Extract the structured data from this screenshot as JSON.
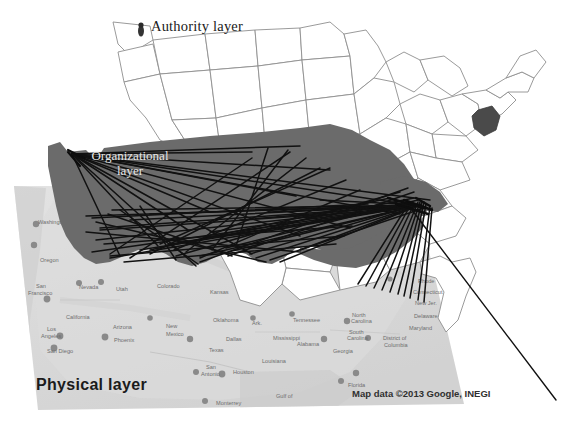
{
  "figure": {
    "type": "layered-network-map-diagram"
  },
  "layers": {
    "authority": {
      "label": "Authority layer",
      "style": "white outline map of US states",
      "outline_color": "#8c8c8c",
      "highlight_region": "Maryland",
      "highlight_color": "#4a4a4a"
    },
    "organizational": {
      "label_line1": "Organizational",
      "label_line2": "layer",
      "style": "dark gray filled US silhouette with black network edges",
      "fill_color": "#6b6b6b",
      "edge_color": "#111111",
      "label_color": "#e8e8e8"
    },
    "physical": {
      "label": "Physical layer",
      "style": "light gray Google Maps terrain in perspective",
      "fill_color": "#d9d9d9",
      "label_color": "#1b1b1b"
    }
  },
  "attribution": {
    "text": "Map data ©2013 Google, INEGI"
  },
  "map_labels": {
    "states": [
      {
        "name": "Washington",
        "x": 38,
        "y": 224
      },
      {
        "name": "Oregon",
        "x": 40,
        "y": 262
      },
      {
        "name": "Nevada",
        "x": 79,
        "y": 289
      },
      {
        "name": "California",
        "x": 66,
        "y": 319
      },
      {
        "name": "Utah",
        "x": 116,
        "y": 291
      },
      {
        "name": "Colorado",
        "x": 157,
        "y": 288
      },
      {
        "name": "Arizona",
        "x": 113,
        "y": 329
      },
      {
        "name": "New",
        "x": 166,
        "y": 328
      },
      {
        "name": "Mexico",
        "x": 166,
        "y": 336
      },
      {
        "name": "Texas",
        "x": 209,
        "y": 352
      },
      {
        "name": "Kansas",
        "x": 210,
        "y": 294
      },
      {
        "name": "Oklahoma",
        "x": 213,
        "y": 322
      },
      {
        "name": "Ark.",
        "x": 252,
        "y": 325
      },
      {
        "name": "Louisiana",
        "x": 262,
        "y": 363
      },
      {
        "name": "Mississippi",
        "x": 273,
        "y": 340
      },
      {
        "name": "Alabama",
        "x": 297,
        "y": 346
      },
      {
        "name": "Tennessee",
        "x": 293,
        "y": 322
      },
      {
        "name": "Georgia",
        "x": 333,
        "y": 353
      },
      {
        "name": "North",
        "x": 352,
        "y": 317
      },
      {
        "name": "Carolina",
        "x": 351,
        "y": 323
      },
      {
        "name": "South",
        "x": 349,
        "y": 334
      },
      {
        "name": "Carolina",
        "x": 347,
        "y": 340
      },
      {
        "name": "Florida",
        "x": 348,
        "y": 387
      },
      {
        "name": "District of",
        "x": 383,
        "y": 340
      },
      {
        "name": "Columbia",
        "x": 384,
        "y": 347
      },
      {
        "name": "Maryland",
        "x": 409,
        "y": 330
      },
      {
        "name": "Delaware",
        "x": 414,
        "y": 318
      },
      {
        "name": "New Jer.",
        "x": 415,
        "y": 305
      },
      {
        "name": "Connecticut",
        "x": 413,
        "y": 294
      },
      {
        "name": "Rhode",
        "x": 418,
        "y": 283
      },
      {
        "name": "M",
        "x": 424,
        "y": 272
      }
    ],
    "cities": [
      {
        "name": "San",
        "x": 36,
        "y": 288
      },
      {
        "name": "Francisco",
        "x": 28,
        "y": 295
      },
      {
        "name": "Los",
        "x": 47,
        "y": 331
      },
      {
        "name": "Angeles",
        "x": 41,
        "y": 338
      },
      {
        "name": "San Diego",
        "x": 47,
        "y": 353
      },
      {
        "name": "Phoenix",
        "x": 114,
        "y": 342
      },
      {
        "name": "Dallas",
        "x": 226,
        "y": 341
      },
      {
        "name": "Houston",
        "x": 233,
        "y": 374
      },
      {
        "name": "San",
        "x": 206,
        "y": 369
      },
      {
        "name": "Antonio",
        "x": 201,
        "y": 376
      },
      {
        "name": "Monterrey",
        "x": 216,
        "y": 405
      }
    ],
    "water": [
      {
        "name": "Gulf of",
        "x": 276,
        "y": 398
      }
    ]
  }
}
